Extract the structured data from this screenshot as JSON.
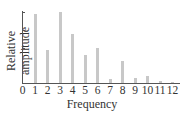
{
  "chart_data": {
    "type": "bar",
    "title": "",
    "xlabel": "Frequency",
    "ylabel": "Relative amplitude",
    "categories": [
      "1",
      "2",
      "3",
      "4",
      "5",
      "6",
      "7",
      "8",
      "9",
      "10",
      "11",
      "12"
    ],
    "values": [
      0.97,
      0.46,
      1.0,
      0.69,
      0.39,
      0.5,
      0.05,
      0.31,
      0.07,
      0.1,
      0.03,
      0.02
    ],
    "x_tick_labels": [
      "0",
      "1",
      "2",
      "3",
      "4",
      "5",
      "6",
      "7",
      "8",
      "9",
      "10",
      "11",
      "12"
    ],
    "y_tick_labels": [],
    "ylim": [
      0,
      1
    ],
    "xlim": [
      0,
      12.5
    ],
    "grid": false,
    "legend": null,
    "bar_color": "#c8c8c8"
  }
}
